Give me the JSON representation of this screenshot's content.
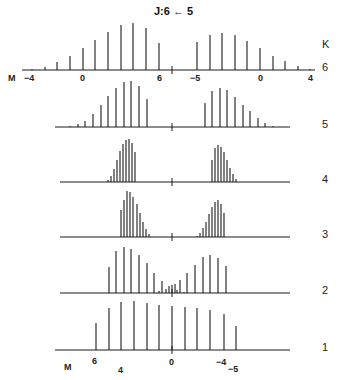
{
  "title": "J:6 ← 5",
  "k_axis_label": "K",
  "m_axis_label": "M",
  "chart_data": {
    "type": "stick-spectrum",
    "title": "J:6 ← 5",
    "ylabel": "K",
    "xlabel": "M",
    "panels": [
      {
        "k": "6",
        "baseline_y": 70,
        "x_start": 22,
        "x_end": 315,
        "center_tick": 172,
        "sticks": [
          {
            "x": 32,
            "h": 1
          },
          {
            "x": 45,
            "h": 3
          },
          {
            "x": 57,
            "h": 8
          },
          {
            "x": 70,
            "h": 14
          },
          {
            "x": 83,
            "h": 22
          },
          {
            "x": 95,
            "h": 30
          },
          {
            "x": 108,
            "h": 38
          },
          {
            "x": 121,
            "h": 45
          },
          {
            "x": 133,
            "h": 47
          },
          {
            "x": 146,
            "h": 42
          },
          {
            "x": 159,
            "h": 27
          },
          {
            "x": 197,
            "h": 28
          },
          {
            "x": 210,
            "h": 35
          },
          {
            "x": 222,
            "h": 37
          },
          {
            "x": 235,
            "h": 35
          },
          {
            "x": 247,
            "h": 29
          },
          {
            "x": 260,
            "h": 22
          },
          {
            "x": 273,
            "h": 14
          },
          {
            "x": 285,
            "h": 9
          },
          {
            "x": 298,
            "h": 4
          },
          {
            "x": 310,
            "h": 1
          }
        ],
        "tick_labels": [
          {
            "text": "M",
            "x": 8,
            "y": 73
          },
          {
            "text": "−4",
            "x": 24,
            "y": 73
          },
          {
            "text": "0",
            "x": 80,
            "y": 73
          },
          {
            "text": "6",
            "x": 157,
            "y": 73
          },
          {
            "text": "−5",
            "x": 190,
            "y": 73
          },
          {
            "text": "0",
            "x": 258,
            "y": 73
          },
          {
            "text": "4",
            "x": 308,
            "y": 73
          }
        ]
      },
      {
        "k": "5",
        "baseline_y": 127,
        "x_start": 55,
        "x_end": 290,
        "center_tick": 172,
        "sticks": [
          {
            "x": 70,
            "h": 1
          },
          {
            "x": 78,
            "h": 3
          },
          {
            "x": 85,
            "h": 6
          },
          {
            "x": 93,
            "h": 13
          },
          {
            "x": 101,
            "h": 22
          },
          {
            "x": 108,
            "h": 31
          },
          {
            "x": 116,
            "h": 39
          },
          {
            "x": 124,
            "h": 45
          },
          {
            "x": 131,
            "h": 46
          },
          {
            "x": 139,
            "h": 41
          },
          {
            "x": 147,
            "h": 28
          },
          {
            "x": 205,
            "h": 24
          },
          {
            "x": 212,
            "h": 36
          },
          {
            "x": 220,
            "h": 39
          },
          {
            "x": 227,
            "h": 37
          },
          {
            "x": 235,
            "h": 30
          },
          {
            "x": 243,
            "h": 22
          },
          {
            "x": 250,
            "h": 16
          },
          {
            "x": 258,
            "h": 9
          },
          {
            "x": 265,
            "h": 4
          },
          {
            "x": 273,
            "h": 1
          }
        ],
        "tick_labels": []
      },
      {
        "k": "4",
        "baseline_y": 182,
        "x_start": 60,
        "x_end": 290,
        "center_tick": 172,
        "sticks": [
          {
            "x": 108,
            "h": 2
          },
          {
            "x": 111,
            "h": 6
          },
          {
            "x": 114,
            "h": 13
          },
          {
            "x": 117,
            "h": 22
          },
          {
            "x": 120,
            "h": 31
          },
          {
            "x": 123,
            "h": 38
          },
          {
            "x": 126,
            "h": 42
          },
          {
            "x": 129,
            "h": 43
          },
          {
            "x": 132,
            "h": 39
          },
          {
            "x": 135,
            "h": 30
          },
          {
            "x": 212,
            "h": 22
          },
          {
            "x": 215,
            "h": 34
          },
          {
            "x": 218,
            "h": 37
          },
          {
            "x": 221,
            "h": 35
          },
          {
            "x": 224,
            "h": 30
          },
          {
            "x": 227,
            "h": 22
          },
          {
            "x": 230,
            "h": 14
          },
          {
            "x": 233,
            "h": 8
          },
          {
            "x": 236,
            "h": 3
          }
        ],
        "tick_labels": []
      },
      {
        "k": "3",
        "baseline_y": 237,
        "x_start": 60,
        "x_end": 290,
        "center_tick": 172,
        "sticks": [
          {
            "x": 121,
            "h": 27
          },
          {
            "x": 124,
            "h": 37
          },
          {
            "x": 127,
            "h": 46
          },
          {
            "x": 130,
            "h": 45
          },
          {
            "x": 133,
            "h": 40
          },
          {
            "x": 137,
            "h": 33
          },
          {
            "x": 140,
            "h": 24
          },
          {
            "x": 143,
            "h": 15
          },
          {
            "x": 146,
            "h": 8
          },
          {
            "x": 149,
            "h": 3
          },
          {
            "x": 197,
            "h": 1
          },
          {
            "x": 200,
            "h": 4
          },
          {
            "x": 203,
            "h": 9
          },
          {
            "x": 206,
            "h": 15
          },
          {
            "x": 209,
            "h": 23
          },
          {
            "x": 212,
            "h": 30
          },
          {
            "x": 215,
            "h": 35
          },
          {
            "x": 218,
            "h": 37
          },
          {
            "x": 221,
            "h": 33
          },
          {
            "x": 224,
            "h": 24
          }
        ],
        "tick_labels": []
      },
      {
        "k": "2",
        "baseline_y": 293,
        "x_start": 60,
        "x_end": 290,
        "center_tick": 172,
        "sticks": [
          {
            "x": 109,
            "h": 26
          },
          {
            "x": 116,
            "h": 42
          },
          {
            "x": 124,
            "h": 46
          },
          {
            "x": 131,
            "h": 44
          },
          {
            "x": 139,
            "h": 38
          },
          {
            "x": 147,
            "h": 30
          },
          {
            "x": 154,
            "h": 20
          },
          {
            "x": 159,
            "h": 2
          },
          {
            "x": 162,
            "h": 12
          },
          {
            "x": 166,
            "h": 4
          },
          {
            "x": 169,
            "h": 7
          },
          {
            "x": 172,
            "h": 8
          },
          {
            "x": 175,
            "h": 9
          },
          {
            "x": 177,
            "h": 3
          },
          {
            "x": 180,
            "h": 13
          },
          {
            "x": 187,
            "h": 20
          },
          {
            "x": 195,
            "h": 28
          },
          {
            "x": 203,
            "h": 36
          },
          {
            "x": 210,
            "h": 38
          },
          {
            "x": 218,
            "h": 35
          },
          {
            "x": 226,
            "h": 27
          },
          {
            "x": 184,
            "h": 1
          }
        ],
        "tick_labels": []
      },
      {
        "k": "1",
        "baseline_y": 350,
        "x_start": 55,
        "x_end": 290,
        "center_tick": 172,
        "sticks": [
          {
            "x": 96,
            "h": 27
          },
          {
            "x": 109,
            "h": 42
          },
          {
            "x": 121,
            "h": 48
          },
          {
            "x": 134,
            "h": 49
          },
          {
            "x": 147,
            "h": 47
          },
          {
            "x": 159,
            "h": 45
          },
          {
            "x": 172,
            "h": 44
          },
          {
            "x": 185,
            "h": 43
          },
          {
            "x": 197,
            "h": 42
          },
          {
            "x": 210,
            "h": 40
          },
          {
            "x": 224,
            "h": 36
          },
          {
            "x": 236,
            "h": 24
          }
        ],
        "tick_labels": [
          {
            "text": "M",
            "x": 64,
            "y": 362
          },
          {
            "text": "6",
            "x": 92,
            "y": 356
          },
          {
            "text": "4",
            "x": 118,
            "y": 365
          },
          {
            "text": "0",
            "x": 169,
            "y": 357
          },
          {
            "text": "−4",
            "x": 216,
            "y": 357
          },
          {
            "text": "−5",
            "x": 228,
            "y": 364
          }
        ]
      }
    ]
  }
}
